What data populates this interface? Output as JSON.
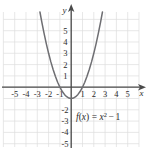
{
  "chart_data": {
    "type": "line",
    "title": "",
    "subtitle": "",
    "xlabel": "x",
    "ylabel": "y",
    "function_label": "f(x) = x² − 1",
    "function_parts": {
      "fname": "f",
      "open_paren": "(",
      "arg": "x",
      "close_paren": ")",
      "equals": "=",
      "base": "x",
      "exponent": "2",
      "minus": "−",
      "constant": "1"
    },
    "expression": "x^2 - 1",
    "grid": true,
    "legend_position": "none",
    "xlim": [
      -5.6,
      6.1
    ],
    "ylim": [
      -5.6,
      6.1
    ],
    "xticks": [
      -5,
      -4,
      -3,
      -2,
      -1,
      1,
      2,
      3,
      4,
      5
    ],
    "yticks": [
      -5,
      -4,
      -3,
      -2,
      1,
      2,
      3,
      4,
      5
    ],
    "xtick_labels": [
      "-5",
      "-4",
      "-3",
      "-2",
      "-1",
      "1",
      "2",
      "3",
      "4",
      "5"
    ],
    "ytick_labels": [
      "-5",
      "-4",
      "-3",
      "-2",
      "1",
      "2",
      "3",
      "4",
      "5"
    ],
    "vertex": [
      0,
      -1
    ],
    "x_intercepts": [
      -1,
      1
    ],
    "y_intercept": -1,
    "x": [
      -2.6,
      -2.4,
      -2.2,
      -2.0,
      -1.8,
      -1.6,
      -1.4,
      -1.2,
      -1.0,
      -0.8,
      -0.6,
      -0.4,
      -0.2,
      0,
      0.2,
      0.4,
      0.6,
      0.8,
      1.0,
      1.2,
      1.4,
      1.6,
      1.8,
      2.0,
      2.2,
      2.4,
      2.6
    ],
    "y": [
      5.76,
      4.76,
      3.84,
      3.0,
      2.24,
      1.56,
      0.96,
      0.44,
      0.0,
      -0.36,
      -0.64,
      -0.84,
      -0.96,
      -1.0,
      -0.96,
      -0.84,
      -0.64,
      -0.36,
      0.0,
      0.44,
      0.96,
      1.56,
      2.24,
      3.0,
      3.84,
      4.76,
      5.76
    ],
    "colors": {
      "curve": "#6e6e72",
      "axis": "#4a4a4a",
      "grid": "#dedede",
      "text": "#2b2b2b",
      "background": "#ffffff"
    }
  }
}
